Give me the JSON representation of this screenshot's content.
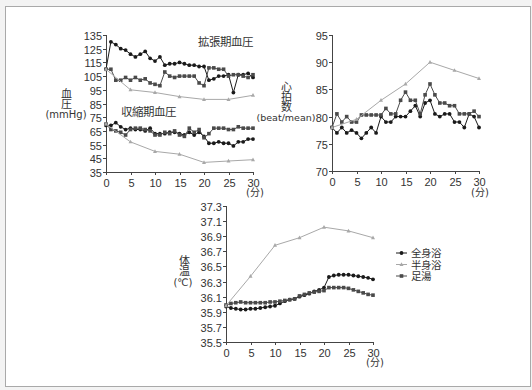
{
  "series_styles": {
    "full": {
      "label": "全身浴",
      "color": "#1a1a1a",
      "marker": "circle",
      "width": 1
    },
    "half": {
      "label": "半身浴",
      "color": "#a8a8a8",
      "marker": "triangle",
      "width": 1
    },
    "foot": {
      "label": "足湯",
      "color": "#4a4a4a",
      "marker": "square",
      "width": 1
    }
  },
  "legend": {
    "items": [
      {
        "style": "full",
        "label": "全身浴"
      },
      {
        "style": "half",
        "label": "半身浴"
      },
      {
        "style": "foot",
        "label": "足湯"
      }
    ]
  },
  "labels": {
    "bp_y": [
      "血",
      "圧",
      "(mmHg)"
    ],
    "hr_y": [
      "心",
      "拍",
      "数",
      "(beat/mean)"
    ],
    "temp_y": [
      "体",
      "温",
      "(℃)"
    ],
    "x_unit": "(分)",
    "bp_upper_annotation": "拡張期血圧",
    "bp_lower_annotation": "収縮期血圧"
  },
  "chart_data": [
    {
      "type": "line",
      "title": "",
      "ylabel": "血圧 (mmHg)",
      "xlabel": "(分)",
      "xlim": [
        0,
        30
      ],
      "ylim": [
        35,
        135
      ],
      "xticks": [
        0,
        5,
        10,
        15,
        20,
        25,
        30
      ],
      "yticks": [
        35,
        45,
        55,
        65,
        75,
        85,
        95,
        105,
        115,
        125,
        135
      ],
      "yticklabels": [
        "35",
        "45",
        "55",
        "65",
        "75",
        "85",
        "95",
        "105",
        "115",
        "125",
        "135"
      ],
      "grid": false,
      "annotations": [
        "拡張期血圧",
        "収縮期血圧"
      ],
      "series": [
        {
          "name": "全身浴 拡張期血圧",
          "style": "full",
          "x_start": 0,
          "x_step": 1,
          "values": [
            110,
            130,
            128,
            125,
            124,
            121,
            119,
            121,
            123,
            118,
            116,
            119,
            113,
            114,
            114,
            115,
            114,
            113,
            113,
            112,
            112,
            102,
            103,
            105,
            105,
            106,
            93,
            106,
            106,
            107,
            104
          ]
        },
        {
          "name": "足湯 拡張期血圧",
          "style": "foot",
          "x_start": 0,
          "x_step": 1,
          "values": [
            110,
            110,
            102,
            102,
            104,
            102,
            104,
            102,
            103,
            100,
            99,
            98,
            108,
            105,
            104,
            105,
            105,
            105,
            105,
            100,
            98,
            111,
            111,
            110,
            110,
            105,
            106,
            106,
            105,
            104,
            106
          ]
        },
        {
          "name": "半身浴 拡張期血圧",
          "style": "half",
          "x_start": 0,
          "x_step": 5,
          "values": [
            110,
            95,
            93,
            90,
            88,
            88,
            91
          ]
        },
        {
          "name": "全身浴 収縮期血圧",
          "style": "full",
          "x_start": 0,
          "x_step": 1,
          "values": [
            69,
            69,
            71,
            68,
            66,
            67,
            66,
            66,
            65,
            67,
            63,
            63,
            63,
            64,
            64,
            63,
            62,
            64,
            62,
            64,
            61,
            56,
            56,
            57,
            56,
            56,
            54,
            57,
            57,
            59,
            59
          ]
        },
        {
          "name": "足湯 収縮期血圧",
          "style": "foot",
          "x_start": 0,
          "x_step": 1,
          "values": [
            70,
            66,
            65,
            64,
            62,
            66,
            67,
            67,
            66,
            65,
            62,
            62,
            64,
            63,
            65,
            62,
            61,
            67,
            64,
            66,
            60,
            63,
            67,
            67,
            67,
            66,
            66,
            68,
            67,
            67,
            67
          ]
        },
        {
          "name": "半身浴 収縮期血圧",
          "style": "half",
          "x_start": 0,
          "x_step": 5,
          "values": [
            70,
            57,
            50,
            48,
            42,
            43,
            44
          ]
        }
      ]
    },
    {
      "type": "line",
      "title": "",
      "ylabel": "心拍数 (beat/mean)",
      "xlabel": "(分)",
      "xlim": [
        0,
        30
      ],
      "ylim": [
        70,
        95
      ],
      "xticks": [
        0,
        5,
        10,
        15,
        20,
        25,
        30
      ],
      "yticks": [
        70,
        75,
        80,
        85,
        90,
        95
      ],
      "yticklabels": [
        "70",
        "75",
        "80",
        "85",
        "90",
        "95"
      ],
      "grid": false,
      "series": [
        {
          "name": "全身浴",
          "style": "full",
          "x_start": 0,
          "x_step": 1,
          "values": [
            78,
            77,
            78,
            77,
            77.5,
            77,
            76,
            77,
            78,
            77,
            80,
            79,
            79,
            80,
            80,
            80,
            81,
            82,
            80,
            82.5,
            83,
            80.5,
            80,
            80.5,
            80.5,
            79,
            79,
            78,
            80.5,
            80,
            78
          ]
        },
        {
          "name": "足湯",
          "style": "foot",
          "x_start": 0,
          "x_step": 1,
          "values": [
            78,
            80.5,
            79,
            80,
            79,
            79,
            80.3,
            80.3,
            80.3,
            80.3,
            80.3,
            81.5,
            80.5,
            80.5,
            83,
            84.5,
            83,
            83,
            80.5,
            84,
            86,
            84,
            82.5,
            82.5,
            82,
            82,
            80.5,
            80.5,
            80.5,
            81,
            80
          ]
        },
        {
          "name": "半身浴",
          "style": "half",
          "x_start": 0,
          "x_step": 5,
          "values": [
            78,
            79.5,
            83,
            86,
            90,
            88.5,
            87
          ]
        }
      ]
    },
    {
      "type": "line",
      "title": "",
      "ylabel": "体温 (℃)",
      "xlabel": "(分)",
      "xlim": [
        0,
        30
      ],
      "ylim": [
        35.5,
        37.3
      ],
      "xticks": [
        0,
        5,
        10,
        15,
        20,
        25,
        30
      ],
      "yticks": [
        35.5,
        35.7,
        35.9,
        36.1,
        36.3,
        36.5,
        36.7,
        36.9,
        37.1,
        37.3
      ],
      "yticklabels": [
        "35.5",
        "35.7",
        "35.9",
        "36.1",
        "36.3",
        "36.5",
        "36.7",
        "36.9",
        "37.1",
        "37.3"
      ],
      "grid": false,
      "legend_position": "right",
      "series": [
        {
          "name": "全身浴",
          "style": "full",
          "x_start": 0,
          "x_step": 1,
          "values": [
            35.97,
            35.95,
            35.94,
            35.93,
            35.93,
            35.94,
            35.94,
            35.95,
            35.96,
            35.97,
            35.98,
            36.01,
            36.04,
            36.06,
            36.07,
            36.1,
            36.12,
            36.14,
            36.17,
            36.19,
            36.22,
            36.36,
            36.38,
            36.39,
            36.39,
            36.39,
            36.38,
            36.37,
            36.36,
            36.35,
            36.33
          ]
        },
        {
          "name": "足湯",
          "style": "foot",
          "x_start": 0,
          "x_step": 1,
          "values": [
            35.99,
            36.01,
            36.02,
            36.03,
            36.02,
            36.02,
            36.02,
            36.02,
            36.02,
            36.03,
            36.03,
            36.04,
            36.05,
            36.06,
            36.07,
            36.11,
            36.13,
            36.15,
            36.16,
            36.17,
            36.18,
            36.22,
            36.22,
            36.22,
            36.22,
            36.21,
            36.19,
            36.17,
            36.15,
            36.13,
            36.12
          ]
        },
        {
          "name": "半身浴",
          "style": "half",
          "x_start": 0,
          "x_step": 5,
          "values": [
            35.98,
            36.37,
            36.78,
            36.88,
            37.02,
            36.97,
            36.88
          ]
        }
      ]
    }
  ]
}
